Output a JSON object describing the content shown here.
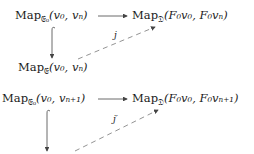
{
  "diagrams": [
    {
      "top_left": {
        "prefix": "Map",
        "sub": "𝔈₀",
        "args": "(v₀, vₙ)"
      },
      "top_right": {
        "prefix": "Map",
        "sub": "𝔇",
        "args": "(F₀v₀, F₀vₙ)"
      },
      "bottom_left": {
        "prefix": "Map",
        "sub": "𝔈",
        "args": "(v₀, vₙ)"
      },
      "dashed_label": "j"
    },
    {
      "top_left": {
        "prefix": "Map",
        "sub": "𝔈₀",
        "args": "(v₀, vₙ₊₁)"
      },
      "top_right": {
        "prefix": "Map",
        "sub": "𝔇",
        "args": "(F₀v₀, F₀vₙ₊₁)"
      },
      "dashed_label": "j′"
    }
  ],
  "colors": {
    "text": "#1a1a1a",
    "arrow": "#444444",
    "dashed": "#777777"
  }
}
